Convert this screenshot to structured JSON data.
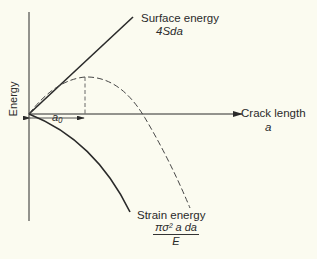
{
  "diagram": {
    "y_axis_label": "Energy",
    "x_axis_label": "Crack length",
    "x_axis_symbol": "a",
    "surface_energy": {
      "label": "Surface energy",
      "formula": "4Sda"
    },
    "strain_energy": {
      "label": "Strain energy",
      "numerator": "πσ² a da",
      "denominator": "E"
    },
    "critical_length_label": "a₀",
    "total_energy_curve": "dashed"
  }
}
